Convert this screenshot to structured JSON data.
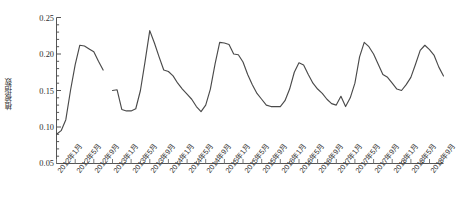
{
  "chart_data": {
    "type": "line",
    "title": "",
    "subtitle": "",
    "xlabel": "",
    "ylabel": "植被指数",
    "ylim": [
      0.05,
      0.25
    ],
    "ytick_labels": [
      "0.25",
      "0.20",
      "0.15",
      "0.10",
      "0.05"
    ],
    "ytick_values": [
      0.25,
      0.2,
      0.15,
      0.1,
      0.05
    ],
    "grid": false,
    "legend": "none",
    "xtick_labels": [
      "2012年1月",
      "2012年5月",
      "2012年9月",
      "2013年1月",
      "2013年5月",
      "2013年9月",
      "2014年1月",
      "2014年5月",
      "2014年9月",
      "2015年1月",
      "2015年5月",
      "2015年9月",
      "2016年1月",
      "2016年5月",
      "2016年9月",
      "2017年1月",
      "2017年5月",
      "2017年9月",
      "2018年1月",
      "2018年5月",
      "2018年9月"
    ],
    "xtick_interval_months": 4,
    "x_start": "2012年1月",
    "x_end": "2018年12月",
    "series": [
      {
        "name": "植被指数",
        "color": "#4a4a4a",
        "x": [
          "2012-01",
          "2012-02",
          "2012-03",
          "2012-04",
          "2012-05",
          "2012-06",
          "2012-07",
          "2012-08",
          "2012-09",
          "2012-10",
          "2012-11",
          "2013-01",
          "2013-02",
          "2013-03",
          "2013-04",
          "2013-05",
          "2013-06",
          "2013-07",
          "2013-08",
          "2013-09",
          "2013-10",
          "2013-11",
          "2013-12",
          "2014-01",
          "2014-02",
          "2014-03",
          "2014-04",
          "2014-05",
          "2014-06",
          "2014-07",
          "2014-08",
          "2014-09",
          "2014-10",
          "2014-11",
          "2014-12",
          "2015-01",
          "2015-02",
          "2015-03",
          "2015-04",
          "2015-05",
          "2015-06",
          "2015-07",
          "2015-08",
          "2015-09",
          "2015-10",
          "2015-11",
          "2015-12",
          "2016-01",
          "2016-02",
          "2016-03",
          "2016-04",
          "2016-05",
          "2016-06",
          "2016-07",
          "2016-08",
          "2016-09",
          "2016-10",
          "2016-11",
          "2016-12",
          "2017-01",
          "2017-02",
          "2017-03",
          "2017-04",
          "2017-05",
          "2017-06",
          "2017-07",
          "2017-08",
          "2017-09",
          "2017-10",
          "2017-11",
          "2017-12",
          "2018-01",
          "2018-02",
          "2018-03",
          "2018-04",
          "2018-05",
          "2018-06",
          "2018-07",
          "2018-08",
          "2018-09",
          "2018-10",
          "2018-11",
          "2018-12"
        ],
        "values": [
          0.09,
          0.095,
          0.11,
          0.15,
          0.185,
          0.212,
          0.211,
          0.207,
          0.203,
          0.19,
          0.178,
          0.15,
          0.151,
          0.124,
          0.122,
          0.122,
          0.125,
          0.15,
          0.19,
          0.232,
          0.215,
          0.196,
          0.178,
          0.176,
          0.17,
          0.16,
          0.152,
          0.145,
          0.138,
          0.128,
          0.121,
          0.13,
          0.152,
          0.186,
          0.216,
          0.215,
          0.213,
          0.2,
          0.199,
          0.189,
          0.172,
          0.158,
          0.146,
          0.138,
          0.13,
          0.128,
          0.128,
          0.128,
          0.136,
          0.152,
          0.175,
          0.188,
          0.185,
          0.172,
          0.16,
          0.152,
          0.146,
          0.138,
          0.132,
          0.13,
          0.142,
          0.128,
          0.14,
          0.16,
          0.196,
          0.216,
          0.21,
          0.2,
          0.186,
          0.172,
          0.168,
          0.16,
          0.152,
          0.15,
          0.158,
          0.168,
          0.186,
          0.205,
          0.212,
          0.206,
          0.198,
          0.182,
          0.17
        ]
      }
    ]
  },
  "caption": {
    "text": ""
  }
}
